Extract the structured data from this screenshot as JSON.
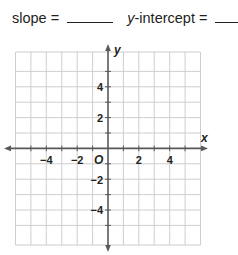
{
  "prompt": {
    "slope_label": "slope =",
    "slope_value": "",
    "intercept_label_var": "y",
    "intercept_label_rest": "-intercept =",
    "intercept_value": ""
  },
  "graph": {
    "x_axis_label": "x",
    "y_axis_label": "y",
    "origin_label": "O",
    "x_tick_labels": [
      "−4",
      "−2",
      "2",
      "4"
    ],
    "y_tick_labels": [
      "4",
      "2",
      "−2",
      "−4"
    ],
    "x_range": [
      -6,
      6
    ],
    "y_range": [
      -6,
      6
    ],
    "grid_step": 1,
    "colors": {
      "grid": "#c8c8c8",
      "axis": "#58595b",
      "text": "#231f20"
    }
  }
}
